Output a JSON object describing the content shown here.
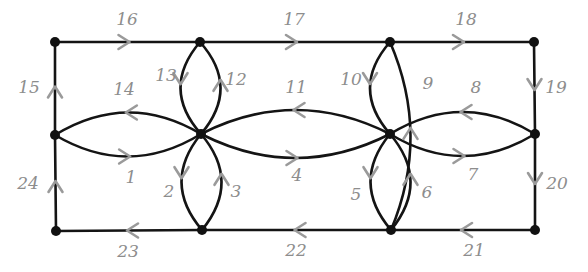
{
  "figure": {
    "background_color": "#ffffff",
    "edge_color": "#141414",
    "arrow_color": "#9a9a9a",
    "label_color": "#8d8d8d",
    "vertex_color": "#111111"
  },
  "vertices": [
    {
      "id": "tl",
      "name": "top-left-vertex",
      "x": 55,
      "y": 42
    },
    {
      "id": "tm1",
      "name": "top-mid-left-vertex",
      "x": 200,
      "y": 42
    },
    {
      "id": "tm2",
      "name": "top-mid-right-vertex",
      "x": 390,
      "y": 42
    },
    {
      "id": "tr",
      "name": "top-right-vertex",
      "x": 534,
      "y": 42
    },
    {
      "id": "ml",
      "name": "middle-left-vertex",
      "x": 55,
      "y": 135
    },
    {
      "id": "mm1",
      "name": "middle-mid-left-vertex",
      "x": 201,
      "y": 134
    },
    {
      "id": "mm2",
      "name": "middle-mid-right-vertex",
      "x": 390,
      "y": 134
    },
    {
      "id": "mr",
      "name": "middle-right-vertex",
      "x": 535,
      "y": 134
    },
    {
      "id": "bl",
      "name": "bottom-left-vertex",
      "x": 56,
      "y": 231
    },
    {
      "id": "bm1",
      "name": "bottom-mid-left-vertex",
      "x": 202,
      "y": 230
    },
    {
      "id": "bm2",
      "name": "bottom-mid-right-vertex",
      "x": 391,
      "y": 230
    },
    {
      "id": "br",
      "name": "bottom-right-vertex",
      "x": 535,
      "y": 230
    }
  ],
  "edges": [
    {
      "label": "1",
      "from": "ml",
      "to": "mm1",
      "shape": "curve-down",
      "bulge": 22,
      "direction": "right",
      "label_x": 131,
      "label_y": 178
    },
    {
      "label": "2",
      "from": "mm1",
      "to": "bm1",
      "shape": "lens-left",
      "bulge": 20,
      "direction": "down",
      "label_x": 169,
      "label_y": 192
    },
    {
      "label": "3",
      "from": "bm1",
      "to": "mm1",
      "shape": "lens-right",
      "bulge": 20,
      "direction": "up",
      "label_x": 236,
      "label_y": 192
    },
    {
      "label": "4",
      "from": "mm1",
      "to": "mm2",
      "shape": "curve-down",
      "bulge": 24,
      "direction": "right",
      "label_x": 297,
      "label_y": 176
    },
    {
      "label": "5",
      "from": "mm2",
      "to": "bm2",
      "shape": "lens-left",
      "bulge": 20,
      "direction": "down",
      "label_x": 356,
      "label_y": 195
    },
    {
      "label": "6",
      "from": "bm2",
      "to": "mm2",
      "shape": "lens-right",
      "bulge": 20,
      "direction": "up",
      "label_x": 427,
      "label_y": 193
    },
    {
      "label": "7",
      "from": "mm2",
      "to": "mr",
      "shape": "curve-down",
      "bulge": 22,
      "direction": "right",
      "label_x": 473,
      "label_y": 175
    },
    {
      "label": "8",
      "from": "mr",
      "to": "mm2",
      "shape": "curve-up",
      "bulge": 22,
      "direction": "left",
      "label_x": 476,
      "label_y": 88
    },
    {
      "label": "9",
      "from": "bm2",
      "to": "tm2",
      "shape": "lens-right",
      "bulge": 20,
      "direction": "up",
      "label_x": 428,
      "label_y": 84
    },
    {
      "label": "10",
      "from": "tm2",
      "to": "mm2",
      "shape": "lens-left",
      "bulge": 20,
      "direction": "down",
      "label_x": 351,
      "label_y": 80
    },
    {
      "label": "11",
      "from": "mm2",
      "to": "mm1",
      "shape": "curve-up",
      "bulge": 24,
      "direction": "left",
      "label_x": 296,
      "label_y": 88
    },
    {
      "label": "12",
      "from": "mm1",
      "to": "tm1",
      "shape": "lens-right",
      "bulge": 20,
      "direction": "up",
      "label_x": 236,
      "label_y": 80
    },
    {
      "label": "13",
      "from": "tm1",
      "to": "mm1",
      "shape": "lens-left",
      "bulge": 20,
      "direction": "down",
      "label_x": 166,
      "label_y": 76
    },
    {
      "label": "14",
      "from": "mm1",
      "to": "ml",
      "shape": "curve-up",
      "bulge": 22,
      "direction": "left",
      "label_x": 124,
      "label_y": 90
    },
    {
      "label": "15",
      "from": "ml",
      "to": "tl",
      "shape": "straight",
      "bulge": 0,
      "direction": "up",
      "label_x": 29,
      "label_y": 88
    },
    {
      "label": "16",
      "from": "tl",
      "to": "tm1",
      "shape": "straight",
      "bulge": 0,
      "direction": "right",
      "label_x": 127,
      "label_y": 20
    },
    {
      "label": "17",
      "from": "tm1",
      "to": "tm2",
      "shape": "straight",
      "bulge": 0,
      "direction": "right",
      "label_x": 294,
      "label_y": 20
    },
    {
      "label": "18",
      "from": "tm2",
      "to": "tr",
      "shape": "straight",
      "bulge": 0,
      "direction": "right",
      "label_x": 466,
      "label_y": 20
    },
    {
      "label": "19",
      "from": "tr",
      "to": "mr",
      "shape": "straight",
      "bulge": 0,
      "direction": "down",
      "label_x": 556,
      "label_y": 88
    },
    {
      "label": "20",
      "from": "mr",
      "to": "br",
      "shape": "straight",
      "bulge": 0,
      "direction": "down",
      "label_x": 557,
      "label_y": 184
    },
    {
      "label": "21",
      "from": "br",
      "to": "bm2",
      "shape": "straight",
      "bulge": 0,
      "direction": "left",
      "label_x": 474,
      "label_y": 251
    },
    {
      "label": "22",
      "from": "bm2",
      "to": "bm1",
      "shape": "straight",
      "bulge": 0,
      "direction": "left",
      "label_x": 296,
      "label_y": 251
    },
    {
      "label": "23",
      "from": "bm1",
      "to": "bl",
      "shape": "straight",
      "bulge": 0,
      "direction": "left",
      "label_x": 128,
      "label_y": 252
    },
    {
      "label": "24",
      "from": "bl",
      "to": "ml",
      "shape": "straight",
      "bulge": 0,
      "direction": "up",
      "label_x": 28,
      "label_y": 184
    }
  ]
}
